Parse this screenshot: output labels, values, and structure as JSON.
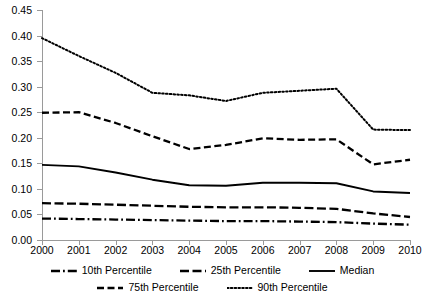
{
  "chart_data": {
    "type": "line",
    "title": "",
    "subtitle": "",
    "xlabel": "",
    "ylabel": "",
    "x": [
      2000,
      2001,
      2002,
      2003,
      2004,
      2005,
      2006,
      2007,
      2008,
      2009,
      2010
    ],
    "xticklabels": [
      "2000",
      "2001",
      "2002",
      "2003",
      "2004",
      "2005",
      "2006",
      "2007",
      "2008",
      "2009",
      "2010"
    ],
    "yticklabels": [
      "0.00",
      "0.05",
      "0.10",
      "0.15",
      "0.20",
      "0.25",
      "0.30",
      "0.35",
      "0.40",
      "0.45"
    ],
    "yticks": [
      0.0,
      0.05,
      0.1,
      0.15,
      0.2,
      0.25,
      0.3,
      0.35,
      0.4,
      0.45
    ],
    "xlim": [
      2000,
      2010
    ],
    "ylim": [
      0.0,
      0.45
    ],
    "grid": false,
    "legend_position": "bottom",
    "series": [
      {
        "name": "10th Percentile",
        "linestyle": "dashdot",
        "color": "#000000",
        "values": [
          0.042,
          0.041,
          0.04,
          0.039,
          0.038,
          0.037,
          0.037,
          0.036,
          0.035,
          0.032,
          0.03
        ]
      },
      {
        "name": "25th Percentile",
        "linestyle": "longdash",
        "color": "#000000",
        "values": [
          0.072,
          0.071,
          0.069,
          0.067,
          0.065,
          0.064,
          0.064,
          0.063,
          0.061,
          0.052,
          0.045
        ]
      },
      {
        "name": "Median",
        "linestyle": "solid",
        "color": "#000000",
        "values": [
          0.147,
          0.144,
          0.132,
          0.118,
          0.107,
          0.106,
          0.112,
          0.112,
          0.111,
          0.095,
          0.092
        ]
      },
      {
        "name": "75th Percentile",
        "linestyle": "dashed",
        "color": "#000000",
        "values": [
          0.249,
          0.25,
          0.229,
          0.203,
          0.178,
          0.186,
          0.199,
          0.196,
          0.197,
          0.148,
          0.157
        ]
      },
      {
        "name": "90th Percentile",
        "linestyle": "dotted",
        "color": "#000000",
        "values": [
          0.395,
          0.36,
          0.327,
          0.288,
          0.283,
          0.272,
          0.288,
          0.292,
          0.296,
          0.216,
          0.215
        ]
      }
    ]
  }
}
